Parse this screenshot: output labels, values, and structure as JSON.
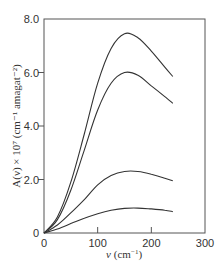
{
  "chart_data": {
    "type": "line",
    "title": "",
    "xlabel": "ν (cm⁻¹)",
    "ylabel": "A(ν) × 10⁷ (cm⁻¹ amagat⁻²)",
    "xlim": [
      0,
      300
    ],
    "ylim": [
      0,
      8.0
    ],
    "x_ticks": [
      "0",
      "100",
      "200",
      "300"
    ],
    "y_ticks": [
      "0",
      "2.0",
      "4.0",
      "6.0",
      "8.0"
    ],
    "grid": false,
    "legend": null,
    "series": [
      {
        "name": "curve-1",
        "x": [
          0,
          25,
          50,
          75,
          100,
          125,
          150,
          175,
          200,
          225,
          240
        ],
        "y": [
          0,
          0.6,
          1.9,
          3.7,
          5.6,
          6.9,
          7.45,
          7.3,
          6.8,
          6.2,
          5.85
        ]
      },
      {
        "name": "curve-2",
        "x": [
          0,
          25,
          50,
          75,
          100,
          125,
          150,
          175,
          200,
          225,
          240
        ],
        "y": [
          0,
          0.5,
          1.6,
          3.1,
          4.6,
          5.6,
          6.0,
          5.9,
          5.5,
          5.1,
          4.85
        ]
      },
      {
        "name": "curve-3",
        "x": [
          0,
          25,
          50,
          75,
          100,
          125,
          150,
          175,
          200,
          225,
          240
        ],
        "y": [
          0,
          0.3,
          0.75,
          1.25,
          1.8,
          2.15,
          2.3,
          2.3,
          2.2,
          2.05,
          1.95
        ]
      },
      {
        "name": "curve-4",
        "x": [
          0,
          25,
          50,
          75,
          100,
          125,
          150,
          175,
          200,
          225,
          240
        ],
        "y": [
          0,
          0.15,
          0.35,
          0.55,
          0.72,
          0.85,
          0.92,
          0.93,
          0.9,
          0.85,
          0.8
        ]
      }
    ]
  },
  "axes": {
    "x_title_main": "ν",
    "x_title_unit": "(cm",
    "x_title_exp": "−1",
    "x_title_close": ")",
    "y_title": "A(ν) × 10⁷ (cm⁻¹ amagat⁻²)"
  }
}
